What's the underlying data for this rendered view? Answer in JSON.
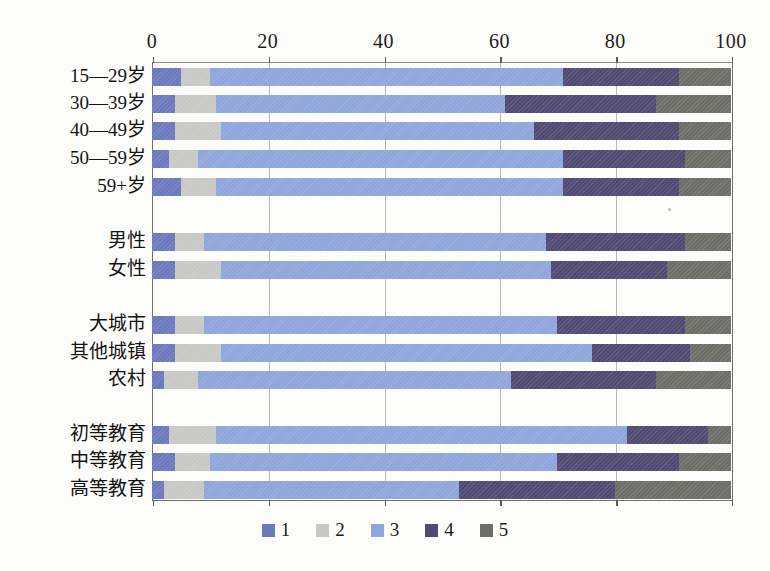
{
  "chart_data": {
    "type": "bar",
    "orientation": "horizontal",
    "stacked": true,
    "stack_mode": "percent",
    "title": "",
    "subtitle": "",
    "xlabel": "",
    "ylabel": "",
    "xlim": [
      0,
      100
    ],
    "xticks": [
      0,
      20,
      40,
      60,
      80,
      100
    ],
    "xtick_labels": [
      "0",
      "20",
      "40",
      "60",
      "80",
      "100"
    ],
    "grid": "vertical",
    "legend_position": "bottom",
    "legend": [
      "1",
      "2",
      "3",
      "4",
      "5"
    ],
    "colors": [
      "#6b79bd",
      "#c8c8c6",
      "#8fa6dc",
      "#514a72",
      "#6e6e68"
    ],
    "categories": [
      "15—29岁",
      "30—39岁",
      "40—49岁",
      "50—59岁",
      "59+岁",
      "男性",
      "女性",
      "大城市",
      "其他城镇",
      "农村",
      "初等教育",
      "中等教育",
      "高等教育"
    ],
    "series": [
      {
        "name": "1",
        "values": [
          5,
          4,
          4,
          3,
          5,
          4,
          4,
          4,
          4,
          2,
          3,
          4,
          2
        ]
      },
      {
        "name": "2",
        "values": [
          5,
          7,
          8,
          5,
          6,
          5,
          8,
          5,
          8,
          6,
          8,
          6,
          7
        ]
      },
      {
        "name": "3",
        "values": [
          61,
          50,
          54,
          63,
          60,
          59,
          57,
          61,
          64,
          54,
          71,
          60,
          44
        ]
      },
      {
        "name": "4",
        "values": [
          20,
          26,
          25,
          21,
          20,
          24,
          20,
          22,
          17,
          25,
          14,
          21,
          27
        ]
      },
      {
        "name": "5",
        "values": [
          9,
          13,
          9,
          8,
          9,
          8,
          11,
          8,
          7,
          13,
          4,
          9,
          20
        ]
      }
    ],
    "cumulative_boundaries": [
      [
        5,
        10,
        71,
        91,
        100
      ],
      [
        4,
        11,
        61,
        87,
        100
      ],
      [
        4,
        12,
        66,
        91,
        100
      ],
      [
        3,
        8,
        71,
        92,
        100
      ],
      [
        5,
        11,
        71,
        91,
        100
      ],
      [
        4,
        9,
        68,
        92,
        100
      ],
      [
        4,
        12,
        69,
        89,
        100
      ],
      [
        4,
        9,
        70,
        92,
        100
      ],
      [
        4,
        12,
        76,
        93,
        100
      ],
      [
        2,
        8,
        62,
        87,
        100
      ],
      [
        3,
        11,
        82,
        96,
        100
      ],
      [
        4,
        10,
        70,
        91,
        100
      ],
      [
        2,
        9,
        53,
        80,
        100
      ]
    ],
    "groups": [
      {
        "name": "age",
        "rows": [
          0,
          1,
          2,
          3,
          4
        ]
      },
      {
        "name": "gender",
        "rows": [
          5,
          6
        ]
      },
      {
        "name": "settlement",
        "rows": [
          7,
          8,
          9
        ]
      },
      {
        "name": "education",
        "rows": [
          10,
          11,
          12
        ]
      }
    ]
  },
  "axis": {
    "ticks": [
      {
        "label": "0",
        "value": 0
      },
      {
        "label": "20",
        "value": 20
      },
      {
        "label": "40",
        "value": 40
      },
      {
        "label": "60",
        "value": 60
      },
      {
        "label": "80",
        "value": 80
      },
      {
        "label": "100",
        "value": 100
      }
    ]
  },
  "rows": [
    {
      "label": "15—29岁",
      "top": 68,
      "values": [
        5,
        5,
        61,
        20,
        9
      ]
    },
    {
      "label": "30—39岁",
      "top": 95,
      "values": [
        4,
        7,
        50,
        26,
        13
      ]
    },
    {
      "label": "40—49岁",
      "top": 122,
      "values": [
        4,
        8,
        54,
        25,
        9
      ]
    },
    {
      "label": "50—59岁",
      "top": 150,
      "values": [
        3,
        5,
        63,
        21,
        8
      ]
    },
    {
      "label": "59+岁",
      "top": 178,
      "values": [
        5,
        6,
        60,
        20,
        9
      ]
    },
    {
      "label": "男性",
      "top": 233,
      "values": [
        4,
        5,
        59,
        24,
        8
      ]
    },
    {
      "label": "女性",
      "top": 261,
      "values": [
        4,
        8,
        57,
        20,
        11
      ]
    },
    {
      "label": "大城市",
      "top": 316,
      "values": [
        4,
        5,
        61,
        22,
        8
      ]
    },
    {
      "label": "其他城镇",
      "top": 344,
      "values": [
        4,
        8,
        64,
        17,
        7
      ]
    },
    {
      "label": "农村",
      "top": 371,
      "values": [
        2,
        6,
        54,
        25,
        13
      ]
    },
    {
      "label": "初等教育",
      "top": 426,
      "values": [
        3,
        8,
        71,
        14,
        4
      ]
    },
    {
      "label": "中等教育",
      "top": 453,
      "values": [
        4,
        6,
        60,
        21,
        9
      ]
    },
    {
      "label": "高等教育",
      "top": 481,
      "values": [
        2,
        7,
        44,
        27,
        20
      ]
    }
  ],
  "legend": {
    "items": [
      {
        "label": "1",
        "color": "#6b79bd"
      },
      {
        "label": "2",
        "color": "#c8c8c6"
      },
      {
        "label": "3",
        "color": "#8fa6dc"
      },
      {
        "label": "4",
        "color": "#514a72"
      },
      {
        "label": "5",
        "color": "#6e6e68"
      }
    ]
  }
}
